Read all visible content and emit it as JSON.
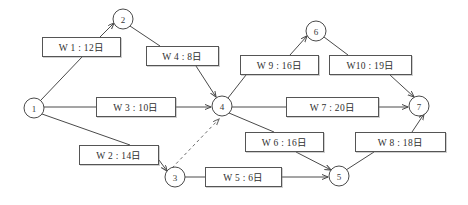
{
  "diagram": {
    "type": "activity-on-arrow network",
    "colors": {
      "stroke": "#4a4a4a",
      "box_border": "#555555",
      "background": "#ffffff",
      "text": "#2f2f2f"
    },
    "nodes": [
      {
        "id": "1",
        "label": "1",
        "cx": 34,
        "cy": 108,
        "r": 10
      },
      {
        "id": "2",
        "label": "2",
        "cx": 123,
        "cy": 19,
        "r": 10
      },
      {
        "id": "3",
        "label": "3",
        "cx": 175,
        "cy": 177,
        "r": 10
      },
      {
        "id": "4",
        "label": "4",
        "cx": 222,
        "cy": 106,
        "r": 10
      },
      {
        "id": "5",
        "label": "5",
        "cx": 339,
        "cy": 176,
        "r": 10
      },
      {
        "id": "6",
        "label": "6",
        "cx": 316,
        "cy": 31,
        "r": 10
      },
      {
        "id": "7",
        "label": "7",
        "cx": 419,
        "cy": 106,
        "r": 10
      }
    ],
    "tasks": [
      {
        "id": "W1",
        "label": "W 1 : 12日",
        "from": "1",
        "to": "2",
        "x": 42,
        "y": 37,
        "w": 79,
        "h": 20
      },
      {
        "id": "W2",
        "label": "W 2 : 14日",
        "from": "1",
        "to": "3",
        "x": 79,
        "y": 145,
        "w": 80,
        "h": 20
      },
      {
        "id": "W3",
        "label": "W 3 : 10日",
        "from": "1",
        "to": "4",
        "x": 96,
        "y": 97,
        "w": 80,
        "h": 20
      },
      {
        "id": "W4",
        "label": "W 4 : 8日",
        "from": "2",
        "to": "4",
        "x": 146,
        "y": 46,
        "w": 73,
        "h": 20
      },
      {
        "id": "W5",
        "label": "W 5 : 6日",
        "from": "3",
        "to": "5",
        "x": 205,
        "y": 167,
        "w": 77,
        "h": 20
      },
      {
        "id": "W6",
        "label": "W 6 : 16日",
        "from": "4",
        "to": "5",
        "x": 245,
        "y": 132,
        "w": 79,
        "h": 20
      },
      {
        "id": "W7",
        "label": "W 7 : 20日",
        "from": "4",
        "to": "7",
        "x": 286,
        "y": 97,
        "w": 93,
        "h": 20
      },
      {
        "id": "W8",
        "label": "W 8 : 18日",
        "from": "5",
        "to": "7",
        "x": 355,
        "y": 132,
        "w": 91,
        "h": 20
      },
      {
        "id": "W9",
        "label": "W 9 : 16日",
        "from": "4",
        "to": "6",
        "x": 240,
        "y": 55,
        "w": 79,
        "h": 20
      },
      {
        "id": "W10",
        "label": "W10 : 19日",
        "from": "6",
        "to": "7",
        "x": 329,
        "y": 55,
        "w": 83,
        "h": 20
      }
    ],
    "dummy_edges": [
      {
        "from": "3",
        "to": "4",
        "style": "dashed"
      }
    ]
  }
}
